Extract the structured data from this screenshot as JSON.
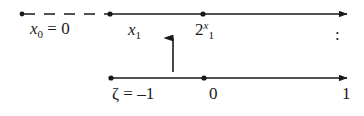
{
  "figure": {
    "kind": "number-line-diagram",
    "width": 364,
    "height": 116,
    "background_color": "#ffffff",
    "ink_color": "#1a1a1a"
  },
  "top_axis": {
    "name": "upper-number-line",
    "y": 14,
    "dashed_from_x": 22,
    "dashed_to_x": 110,
    "solid_from_x": 110,
    "arrow_tip_x": 347,
    "points": [
      {
        "x": 22,
        "label_id": "x0"
      },
      {
        "x": 110,
        "label_id": "x1"
      },
      {
        "x": 203,
        "label_id": "2x1"
      }
    ]
  },
  "bottom_axis": {
    "name": "lower-number-line",
    "y": 78,
    "solid_from_x": 111,
    "arrow_tip_x": 347,
    "points": [
      {
        "x": 111,
        "label_id": "zeta"
      },
      {
        "x": 204,
        "label_id": "zero"
      }
    ]
  },
  "vertical_arrow": {
    "name": "upward-arrow",
    "x": 173,
    "from_y": 72,
    "to_y": 38,
    "direction": "up"
  },
  "labels": {
    "x0": {
      "base": "x",
      "subscript": "0",
      "equals": "=",
      "value": "0",
      "text": "x0 = 0"
    },
    "x1": {
      "base": "x",
      "subscript": "1",
      "text": "x1"
    },
    "two_pow_x1": {
      "base": "2",
      "superscript": "x",
      "subscript": "1",
      "text": "2^x1"
    },
    "colon": {
      "text": ":"
    },
    "zeta": {
      "base": "ζ",
      "equals": "=",
      "value": "–1",
      "text": "ζ = –1"
    },
    "zero": {
      "text": "0"
    },
    "one": {
      "text": "1"
    }
  }
}
